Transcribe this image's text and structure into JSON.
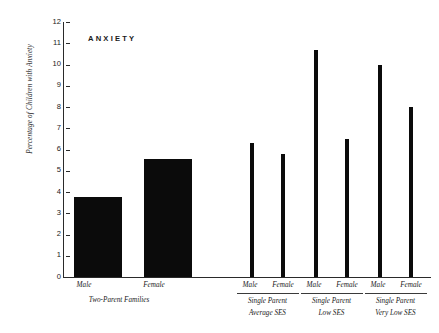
{
  "chart_data": {
    "type": "bar",
    "title": "ANXIETY",
    "xlabel": "",
    "ylabel": "Percentage of Children with Anxiety",
    "ylim": [
      0,
      12
    ],
    "ytick_labels": [
      "12",
      "11",
      "10",
      "9",
      "8",
      "7",
      "6",
      "5",
      "4",
      "3",
      "2",
      "1",
      "0"
    ],
    "ytick_values": [
      12,
      11,
      10,
      9,
      8,
      7,
      6,
      5,
      4,
      3,
      2,
      1,
      0
    ],
    "grid": false,
    "legend": "none",
    "categories": [
      "Male",
      "Female",
      "Male",
      "Female",
      "Male",
      "Female",
      "Male",
      "Female"
    ],
    "values": [
      3.75,
      5.55,
      6.3,
      5.8,
      10.7,
      6.5,
      10.0,
      8.0
    ],
    "groups": [
      {
        "label": "Two-Parent Families",
        "sublabel": "",
        "rule": false,
        "bars": [
          {
            "category": "Male",
            "value": 3.75
          },
          {
            "category": "Female",
            "value": 5.55
          }
        ]
      },
      {
        "label": "Single Parent",
        "sublabel": "Average SES",
        "rule": true,
        "bars": [
          {
            "category": "Male",
            "value": 6.3
          },
          {
            "category": "Female",
            "value": 5.8
          }
        ]
      },
      {
        "label": "Single Parent",
        "sublabel": "Low SES",
        "rule": true,
        "bars": [
          {
            "category": "Male",
            "value": 10.7
          },
          {
            "category": "Female",
            "value": 6.5
          }
        ]
      },
      {
        "label": "Single Parent",
        "sublabel": "Very Low SES",
        "rule": true,
        "bars": [
          {
            "category": "Male",
            "value": 10.0
          },
          {
            "category": "Female",
            "value": 8.0
          }
        ]
      }
    ],
    "colors": {
      "bar": "#0b0b0b",
      "axis": "#2a2a2a",
      "text": "#1a1a1a",
      "background": "#ffffff"
    }
  }
}
